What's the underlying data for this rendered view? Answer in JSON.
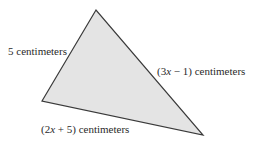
{
  "diagram": {
    "type": "triangle",
    "fill_color": "#e4e4e4",
    "stroke_color": "#3a3a3a",
    "vertices": {
      "top": [
        96,
        10
      ],
      "left": [
        42,
        101
      ],
      "right": [
        203,
        135
      ]
    },
    "sides": [
      {
        "id": "left",
        "between": [
          "top",
          "left"
        ],
        "label": "5 centimeters"
      },
      {
        "id": "right",
        "between": [
          "top",
          "right"
        ],
        "label_prefix": "(3",
        "label_var": "x",
        "label_suffix": " − 1) centimeters",
        "label": "(3x − 1) centimeters"
      },
      {
        "id": "bottom",
        "between": [
          "left",
          "right"
        ],
        "label_prefix": "(2",
        "label_var": "x",
        "label_suffix": " + 5) centimeters",
        "label": "(2x + 5) centimeters"
      }
    ]
  }
}
